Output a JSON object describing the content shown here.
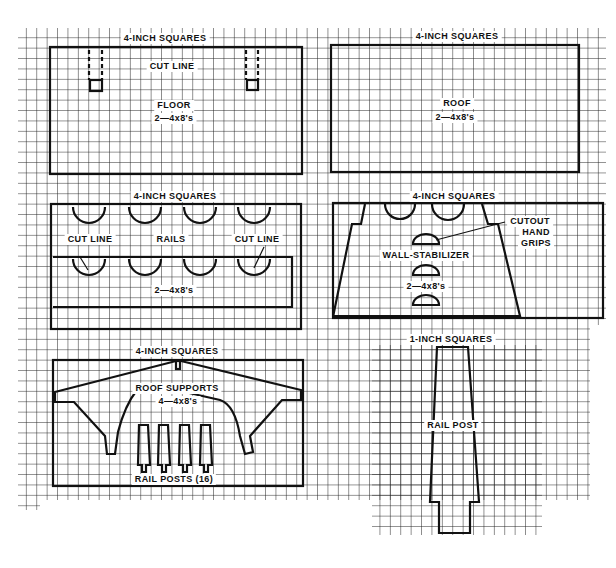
{
  "panels": {
    "floor": {
      "scale_label": "4-INCH SQUARES",
      "cut_line_label": "CUT LINE",
      "part_name": "FLOOR",
      "material": "2—4x8's"
    },
    "roof": {
      "scale_label": "4-INCH SQUARES",
      "part_name": "ROOF",
      "material": "2—4x8's"
    },
    "rails": {
      "scale_label": "4-INCH SQUARES",
      "cut_line_left": "CUT LINE",
      "part_name": "RAILS",
      "cut_line_right": "CUT LINE",
      "material": "2—4x8's"
    },
    "wall_stabilizer": {
      "scale_label": "4-INCH SQUARES",
      "callout_line1": "CUTOUT",
      "callout_line2": "HAND",
      "callout_line3": "GRIPS",
      "part_name": "WALL-STABILIZER",
      "material": "2—4x8's"
    },
    "roof_supports": {
      "scale_label": "4-INCH SQUARES",
      "part_name": "ROOF SUPPORTS",
      "material": "4—4x8's",
      "rail_posts_label": "RAIL POSTS (16)"
    },
    "rail_post": {
      "scale_label": "1-INCH SQUARES",
      "part_name": "RAIL POST"
    }
  },
  "colors": {
    "grid": "#222222",
    "outline": "#111111",
    "background": "#ffffff"
  }
}
